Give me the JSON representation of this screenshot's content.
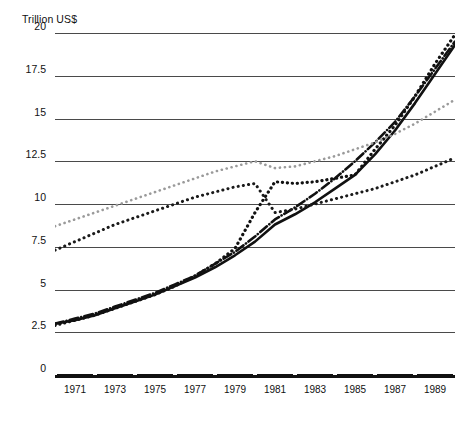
{
  "chart_data": {
    "type": "line",
    "title": "",
    "subtitle": "",
    "ylabel": "Trillion US$",
    "xlabel": "",
    "ylim": [
      0,
      20
    ],
    "xlim": [
      1970,
      1990
    ],
    "grid": true,
    "legend": "none",
    "yticks": [
      "0",
      "2.5",
      "5",
      "7.5",
      "10",
      "12.5",
      "15",
      "17.5",
      "20"
    ],
    "ytick_values": [
      0,
      2.5,
      5,
      7.5,
      10,
      12.5,
      15,
      17.5,
      20
    ],
    "xticks": [
      "1971",
      "1973",
      "1975",
      "1977",
      "1979",
      "1981",
      "1983",
      "1985",
      "1987",
      "1989"
    ],
    "xtick_values": [
      1971,
      1973,
      1975,
      1977,
      1979,
      1981,
      1983,
      1985,
      1987,
      1989
    ],
    "x": [
      1970,
      1971,
      1972,
      1973,
      1974,
      1975,
      1976,
      1977,
      1978,
      1979,
      1980,
      1981,
      1982,
      1983,
      1984,
      1985,
      1986,
      1987,
      1988,
      1989,
      1990
    ],
    "series": [
      {
        "name": "series-solid",
        "style": "solid",
        "color": "#111111",
        "width": 2.6,
        "values": [
          3.0,
          3.2,
          3.5,
          3.9,
          4.3,
          4.7,
          5.2,
          5.7,
          6.3,
          7.0,
          7.8,
          8.8,
          9.4,
          10.1,
          10.9,
          11.7,
          12.9,
          14.3,
          15.9,
          17.6,
          19.3
        ]
      },
      {
        "name": "series-dashdot",
        "style": "dash-dot",
        "color": "#111111",
        "width": 2.6,
        "values": [
          3.0,
          3.3,
          3.6,
          4.0,
          4.4,
          4.8,
          5.3,
          5.8,
          6.5,
          7.2,
          8.1,
          9.1,
          9.8,
          10.6,
          11.5,
          12.5,
          13.6,
          14.8,
          16.3,
          17.9,
          19.5
        ]
      },
      {
        "name": "series-thick-dotted",
        "style": "dotted-thick",
        "color": "#111111",
        "width": 3.2,
        "values": [
          2.9,
          3.2,
          3.5,
          3.9,
          4.3,
          4.7,
          5.2,
          5.8,
          6.5,
          7.4,
          9.5,
          11.3,
          11.2,
          11.3,
          11.5,
          11.7,
          13.2,
          14.6,
          16.3,
          18.2,
          19.9
        ]
      },
      {
        "name": "series-light-dotted",
        "style": "dotted-light",
        "color": "#9a9a9a",
        "width": 2.6,
        "values": [
          8.7,
          9.1,
          9.5,
          9.9,
          10.3,
          10.7,
          11.1,
          11.5,
          11.9,
          12.2,
          12.5,
          12.1,
          12.2,
          12.5,
          12.8,
          13.2,
          13.6,
          14.1,
          14.7,
          15.4,
          16.1
        ]
      },
      {
        "name": "series-medium-dotted",
        "style": "dotted-medium",
        "color": "#1a1a1a",
        "width": 3.0,
        "values": [
          7.3,
          7.8,
          8.3,
          8.8,
          9.2,
          9.6,
          10.0,
          10.4,
          10.7,
          11.0,
          11.2,
          9.5,
          9.7,
          10.0,
          10.3,
          10.6,
          10.9,
          11.3,
          11.7,
          12.2,
          12.7
        ]
      }
    ]
  }
}
